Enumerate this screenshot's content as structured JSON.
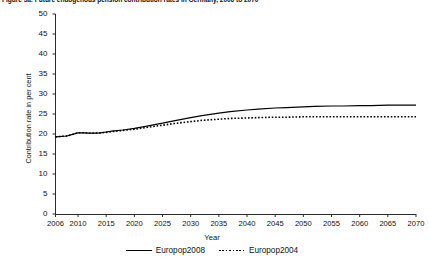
{
  "figure": {
    "title": "Figure 5a: Future endogenous pension contribution rates in Germany, 2006 to 2070"
  },
  "legend": {
    "items": [
      {
        "label": "Europop2008",
        "style": "solid",
        "color": "#000000"
      },
      {
        "label": "Europop2004",
        "style": "dotted",
        "color": "#000000"
      }
    ]
  },
  "chart_data": {
    "type": "line",
    "title": "Figure 5a: Future endogenous pension contribution rates in Germany, 2006 to 2070",
    "xlabel": "Year",
    "ylabel": "Contribution rate in per cent",
    "xlim": [
      2006,
      2070
    ],
    "ylim": [
      0,
      50
    ],
    "yticks": [
      0,
      5,
      10,
      15,
      20,
      25,
      30,
      35,
      40,
      45,
      50
    ],
    "xticks": [
      2006,
      2010,
      2015,
      2020,
      2025,
      2030,
      2035,
      2040,
      2045,
      2050,
      2055,
      2060,
      2065,
      2070
    ],
    "grid": false,
    "legend_position": "bottom",
    "x": [
      2006,
      2008,
      2010,
      2011,
      2012,
      2013,
      2014,
      2015,
      2016,
      2018,
      2020,
      2022,
      2025,
      2027,
      2030,
      2032,
      2035,
      2037,
      2040,
      2042,
      2045,
      2047,
      2050,
      2052,
      2055,
      2057,
      2060,
      2062,
      2065,
      2067,
      2070
    ],
    "series": [
      {
        "name": "Europop2008",
        "style": "solid",
        "color": "#000000",
        "values": [
          19.3,
          19.5,
          20.3,
          20.3,
          20.2,
          20.2,
          20.3,
          20.5,
          20.7,
          21.0,
          21.4,
          21.9,
          22.7,
          23.3,
          24.1,
          24.6,
          25.2,
          25.6,
          26.0,
          26.2,
          26.5,
          26.6,
          26.8,
          26.9,
          27.0,
          27.0,
          27.1,
          27.1,
          27.2,
          27.2,
          27.2
        ]
      },
      {
        "name": "Europop2004",
        "style": "dotted",
        "color": "#000000",
        "values": [
          19.3,
          19.5,
          20.3,
          20.3,
          20.2,
          20.2,
          20.3,
          20.4,
          20.6,
          20.9,
          21.2,
          21.6,
          22.2,
          22.6,
          23.1,
          23.4,
          23.7,
          23.9,
          24.0,
          24.1,
          24.2,
          24.2,
          24.3,
          24.3,
          24.3,
          24.3,
          24.3,
          24.3,
          24.3,
          24.3,
          24.3
        ]
      }
    ]
  }
}
